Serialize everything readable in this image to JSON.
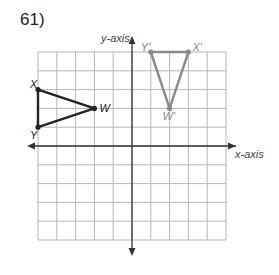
{
  "problem": {
    "number": "61)"
  },
  "axes": {
    "x_label": "x-axis",
    "y_label": "y-axis"
  },
  "grid": {
    "xmin": -5,
    "xmax": 5,
    "ymin": -5,
    "ymax": 5
  },
  "original": {
    "color": "#222222",
    "vertices": [
      {
        "name": "X",
        "x": -5,
        "y": 3
      },
      {
        "name": "W",
        "x": -2,
        "y": 2
      },
      {
        "name": "Y",
        "x": -5,
        "y": 1
      }
    ]
  },
  "image": {
    "color": "#8a8a8a",
    "vertices": [
      {
        "name": "Y'",
        "x": 1,
        "y": 5
      },
      {
        "name": "X'",
        "x": 3,
        "y": 5
      },
      {
        "name": "W'",
        "x": 2,
        "y": 2
      }
    ]
  }
}
